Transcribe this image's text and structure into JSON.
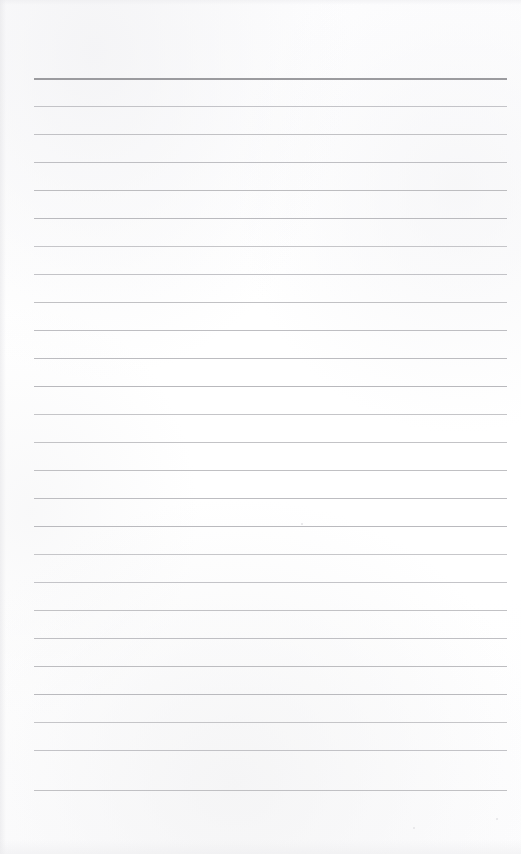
{
  "document": {
    "kind": "lined-paper-page",
    "title": "",
    "body_text": "",
    "page_width": 521,
    "page_height": 854,
    "background_color": "#fefefe",
    "is_blank": true
  },
  "ruling": {
    "line_count": 26,
    "first_line_y": 78,
    "line_spacing": 28,
    "line_left": 34,
    "line_right": 507,
    "line_color": "#b9b9bd",
    "header_line_color": "#9b9b9f",
    "header_line_index": 0,
    "header_line_thickness": 2,
    "line_thickness": 1
  },
  "lines": [
    {
      "index": 1,
      "y": 78,
      "content": ""
    },
    {
      "index": 2,
      "y": 106,
      "content": ""
    },
    {
      "index": 3,
      "y": 134,
      "content": ""
    },
    {
      "index": 4,
      "y": 162,
      "content": ""
    },
    {
      "index": 5,
      "y": 190,
      "content": ""
    },
    {
      "index": 6,
      "y": 218,
      "content": ""
    },
    {
      "index": 7,
      "y": 246,
      "content": ""
    },
    {
      "index": 8,
      "y": 274,
      "content": ""
    },
    {
      "index": 9,
      "y": 302,
      "content": ""
    },
    {
      "index": 10,
      "y": 330,
      "content": ""
    },
    {
      "index": 11,
      "y": 358,
      "content": ""
    },
    {
      "index": 12,
      "y": 386,
      "content": ""
    },
    {
      "index": 13,
      "y": 414,
      "content": ""
    },
    {
      "index": 14,
      "y": 442,
      "content": ""
    },
    {
      "index": 15,
      "y": 470,
      "content": ""
    },
    {
      "index": 16,
      "y": 498,
      "content": ""
    },
    {
      "index": 17,
      "y": 526,
      "content": ""
    },
    {
      "index": 18,
      "y": 554,
      "content": ""
    },
    {
      "index": 19,
      "y": 582,
      "content": ""
    },
    {
      "index": 20,
      "y": 610,
      "content": ""
    },
    {
      "index": 21,
      "y": 638,
      "content": ""
    },
    {
      "index": 22,
      "y": 666,
      "content": ""
    },
    {
      "index": 23,
      "y": 694,
      "content": ""
    },
    {
      "index": 24,
      "y": 722,
      "content": ""
    },
    {
      "index": 25,
      "y": 750,
      "content": ""
    },
    {
      "index": 26,
      "y": 790,
      "content": ""
    }
  ],
  "margins": {
    "top_blank_height": 78,
    "bottom_blank_height": 64,
    "left_margin": 34,
    "right_margin": 14
  },
  "specks": [
    {
      "x": 301,
      "y": 523,
      "size": 2
    },
    {
      "x": 496,
      "y": 818,
      "size": 2
    },
    {
      "x": 413,
      "y": 827,
      "size": 2
    }
  ]
}
